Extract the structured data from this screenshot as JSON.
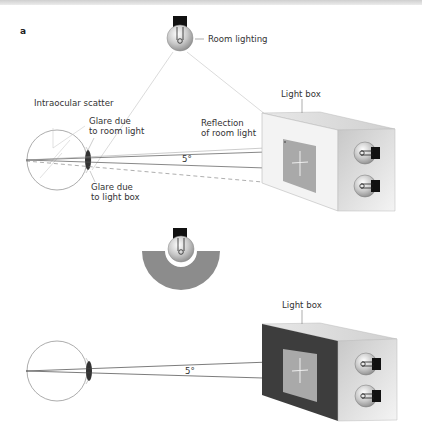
{
  "figure": {
    "panel_label": "a",
    "top_panel": {
      "labels": {
        "room_lighting": "Room lighting",
        "intraocular_scatter": "Intraocular scatter",
        "glare_room_1": "Glare due",
        "glare_room_2": "to room light",
        "glare_box_1": "Glare due",
        "glare_box_2": "to light box",
        "reflection_1": "Reflection",
        "reflection_2": "of room light",
        "light_box": "Light box",
        "angle": "5°"
      },
      "light_box_front_color": "#f2f2f2"
    },
    "middle": {
      "description": "shielded room light (lamp with gray semicircular shade)",
      "shade_color": "#8c8c8c"
    },
    "bottom_panel": {
      "labels": {
        "light_box": "Light box",
        "angle": "5°"
      },
      "light_box_front_color": "#3d3d3d"
    }
  }
}
